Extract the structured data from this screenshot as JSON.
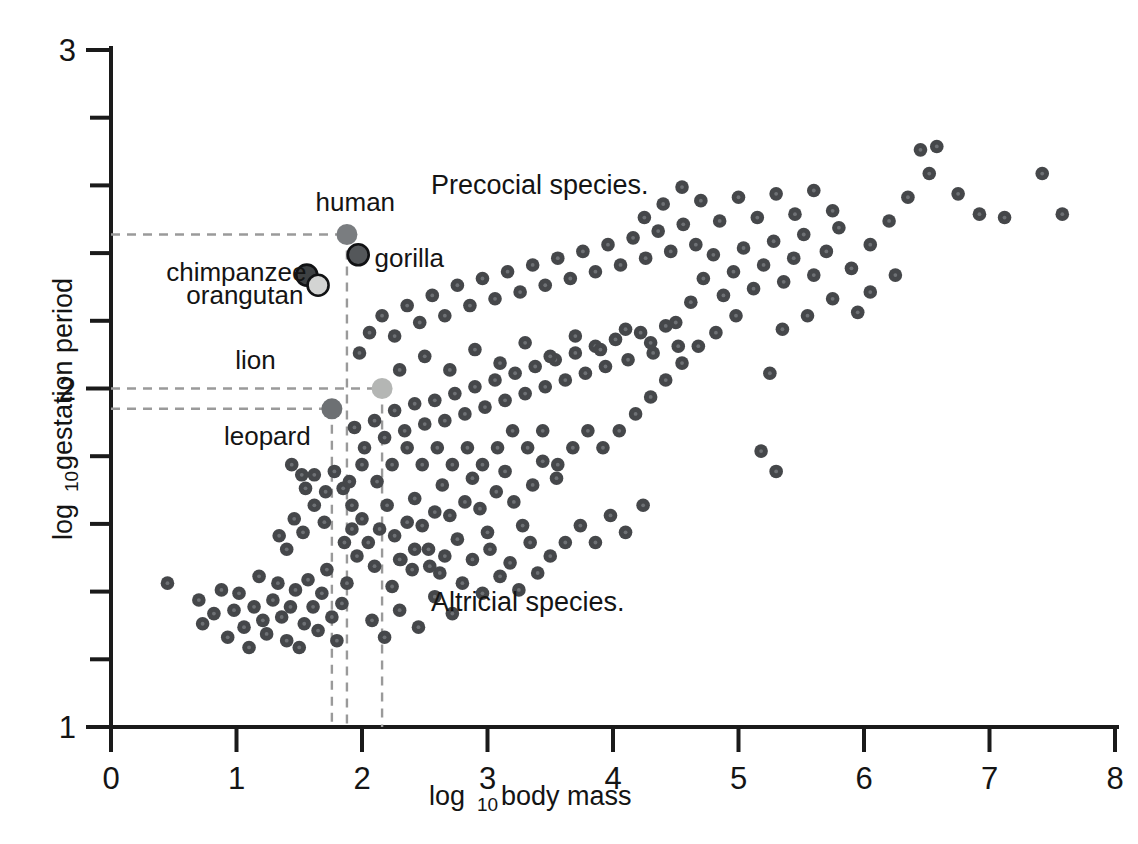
{
  "chart_data": {
    "type": "scatter",
    "title": "",
    "xlabel": "log 10 body mass",
    "xlabel_main": "log",
    "xlabel_sub": "10",
    "xlabel_tail": "body mass",
    "ylabel": "log 10 gestation period",
    "ylabel_main": "log",
    "ylabel_sub": "10",
    "ylabel_tail": "gestation period",
    "xlim": [
      0,
      8
    ],
    "ylim": [
      1,
      3
    ],
    "xticks": [
      0,
      1,
      2,
      3,
      4,
      5,
      6,
      7,
      8
    ],
    "xtick_labels": [
      "0",
      "1",
      "2",
      "3",
      "4",
      "5",
      "6",
      "7",
      "8"
    ],
    "yticks": [
      1,
      2,
      3
    ],
    "ytick_labels": [
      "1",
      "2",
      "3"
    ],
    "y_minor_ticks": [
      1.2,
      1.4,
      1.6,
      1.8,
      2.2,
      2.4,
      2.6,
      2.8
    ],
    "grid": false,
    "legend": "none",
    "marker_color": "#45474a",
    "marker_core_color": "#6e7175",
    "guide_color": "#9a9a9a",
    "annotations": [
      {
        "id": "precocial",
        "text": "Precocial species.",
        "x": 2.55,
        "y": 2.6
      },
      {
        "id": "altricial",
        "text": "Altricial species.",
        "x": 2.55,
        "y": 1.37
      }
    ],
    "highlighted": [
      {
        "name": "human",
        "label": "human",
        "x": 1.88,
        "y": 2.455,
        "color": "#7a7d80",
        "ring": false,
        "label_x": 1.63,
        "label_y": 2.55,
        "guide_h": true,
        "guide_v": true
      },
      {
        "name": "gorilla",
        "label": "gorilla",
        "x": 1.97,
        "y": 2.395,
        "color": "#54575a",
        "ring": true,
        "label_x": 2.1,
        "label_y": 2.385,
        "guide_h": false,
        "guide_v": false
      },
      {
        "name": "chimpanzee",
        "label": "chimpanzee",
        "x": 1.56,
        "y": 2.335,
        "color": "#3e4143",
        "ring": true,
        "label_x": 0.44,
        "label_y": 2.345,
        "guide_h": false,
        "guide_v": false
      },
      {
        "name": "orangutan",
        "label": "orangutan",
        "x": 1.65,
        "y": 2.305,
        "color": "#d3d4d3",
        "ring": true,
        "label_x": 0.6,
        "label_y": 2.275,
        "guide_h": false,
        "guide_v": false
      },
      {
        "name": "lion",
        "label": "lion",
        "x": 2.16,
        "y": 2.0,
        "color": "#b4b6b4",
        "ring": false,
        "label_x": 0.99,
        "label_y": 2.085,
        "guide_h": true,
        "guide_v": true
      },
      {
        "name": "leopard",
        "label": "leopard",
        "x": 1.76,
        "y": 1.94,
        "color": "#6d7073",
        "ring": false,
        "label_x": 0.9,
        "label_y": 1.86,
        "guide_h": true,
        "guide_v": true
      }
    ],
    "points": [
      [
        0.45,
        1.425
      ],
      [
        0.7,
        1.375
      ],
      [
        0.73,
        1.305
      ],
      [
        0.82,
        1.335
      ],
      [
        0.88,
        1.405
      ],
      [
        0.93,
        1.265
      ],
      [
        0.98,
        1.345
      ],
      [
        1.02,
        1.395
      ],
      [
        1.06,
        1.295
      ],
      [
        1.1,
        1.235
      ],
      [
        1.14,
        1.355
      ],
      [
        1.18,
        1.445
      ],
      [
        1.21,
        1.315
      ],
      [
        1.24,
        1.275
      ],
      [
        1.29,
        1.375
      ],
      [
        1.33,
        1.425
      ],
      [
        1.36,
        1.325
      ],
      [
        1.4,
        1.255
      ],
      [
        1.43,
        1.355
      ],
      [
        1.47,
        1.405
      ],
      [
        1.5,
        1.235
      ],
      [
        1.54,
        1.305
      ],
      [
        1.57,
        1.435
      ],
      [
        1.61,
        1.355
      ],
      [
        1.65,
        1.285
      ],
      [
        1.68,
        1.395
      ],
      [
        1.72,
        1.465
      ],
      [
        1.76,
        1.325
      ],
      [
        1.8,
        1.255
      ],
      [
        1.84,
        1.365
      ],
      [
        1.88,
        1.425
      ],
      [
        1.34,
        1.565
      ],
      [
        1.4,
        1.525
      ],
      [
        1.46,
        1.615
      ],
      [
        1.53,
        1.575
      ],
      [
        1.62,
        1.655
      ],
      [
        1.7,
        1.605
      ],
      [
        1.55,
        1.705
      ],
      [
        1.62,
        1.745
      ],
      [
        1.71,
        1.695
      ],
      [
        1.78,
        1.755
      ],
      [
        1.85,
        1.705
      ],
      [
        1.92,
        1.655
      ],
      [
        1.44,
        1.775
      ],
      [
        1.52,
        1.745
      ],
      [
        1.86,
        1.545
      ],
      [
        1.92,
        1.585
      ],
      [
        1.96,
        1.505
      ],
      [
        2.0,
        1.615
      ],
      [
        2.05,
        1.545
      ],
      [
        2.1,
        1.475
      ],
      [
        2.14,
        1.585
      ],
      [
        2.2,
        1.655
      ],
      [
        2.26,
        1.565
      ],
      [
        2.31,
        1.495
      ],
      [
        2.36,
        1.605
      ],
      [
        2.42,
        1.675
      ],
      [
        2.48,
        1.595
      ],
      [
        2.53,
        1.525
      ],
      [
        2.58,
        1.635
      ],
      [
        2.64,
        1.715
      ],
      [
        2.7,
        1.625
      ],
      [
        2.76,
        1.555
      ],
      [
        2.82,
        1.665
      ],
      [
        2.88,
        1.735
      ],
      [
        2.94,
        1.645
      ],
      [
        3.0,
        1.575
      ],
      [
        3.07,
        1.695
      ],
      [
        3.14,
        1.755
      ],
      [
        3.21,
        1.665
      ],
      [
        3.28,
        1.595
      ],
      [
        3.36,
        1.715
      ],
      [
        3.44,
        1.785
      ],
      [
        2.08,
        1.315
      ],
      [
        2.18,
        1.265
      ],
      [
        2.3,
        1.345
      ],
      [
        2.45,
        1.295
      ],
      [
        2.58,
        1.385
      ],
      [
        2.72,
        1.335
      ],
      [
        2.24,
        1.415
      ],
      [
        2.4,
        1.465
      ],
      [
        2.96,
        1.395
      ],
      [
        3.1,
        1.445
      ],
      [
        3.25,
        1.405
      ],
      [
        3.4,
        1.455
      ],
      [
        2.62,
        1.455
      ],
      [
        2.8,
        1.425
      ],
      [
        3.55,
        1.735
      ],
      [
        1.94,
        1.885
      ],
      [
        2.02,
        1.825
      ],
      [
        2.1,
        1.905
      ],
      [
        2.18,
        1.855
      ],
      [
        2.26,
        1.935
      ],
      [
        2.34,
        1.875
      ],
      [
        2.42,
        1.955
      ],
      [
        2.5,
        1.895
      ],
      [
        2.58,
        1.965
      ],
      [
        2.66,
        1.905
      ],
      [
        2.74,
        1.985
      ],
      [
        2.82,
        1.925
      ],
      [
        2.9,
        2.005
      ],
      [
        2.98,
        1.945
      ],
      [
        3.06,
        2.025
      ],
      [
        3.14,
        1.965
      ],
      [
        3.22,
        2.045
      ],
      [
        3.3,
        1.985
      ],
      [
        3.38,
        2.065
      ],
      [
        3.46,
        2.005
      ],
      [
        3.54,
        2.085
      ],
      [
        3.62,
        2.025
      ],
      [
        3.7,
        2.105
      ],
      [
        3.78,
        2.045
      ],
      [
        3.86,
        2.125
      ],
      [
        3.94,
        2.065
      ],
      [
        4.02,
        2.145
      ],
      [
        4.12,
        2.085
      ],
      [
        4.22,
        2.165
      ],
      [
        4.32,
        2.105
      ],
      [
        4.42,
        2.185
      ],
      [
        4.52,
        2.125
      ],
      [
        1.98,
        2.105
      ],
      [
        2.06,
        2.165
      ],
      [
        2.16,
        2.215
      ],
      [
        2.26,
        2.155
      ],
      [
        2.36,
        2.245
      ],
      [
        2.46,
        2.195
      ],
      [
        2.56,
        2.275
      ],
      [
        2.66,
        2.215
      ],
      [
        2.76,
        2.305
      ],
      [
        2.86,
        2.245
      ],
      [
        2.96,
        2.325
      ],
      [
        3.06,
        2.265
      ],
      [
        3.16,
        2.345
      ],
      [
        3.26,
        2.285
      ],
      [
        3.36,
        2.365
      ],
      [
        3.46,
        2.305
      ],
      [
        3.56,
        2.385
      ],
      [
        3.66,
        2.325
      ],
      [
        3.76,
        2.405
      ],
      [
        3.86,
        2.345
      ],
      [
        3.96,
        2.425
      ],
      [
        4.06,
        2.365
      ],
      [
        4.16,
        2.445
      ],
      [
        4.26,
        2.385
      ],
      [
        4.36,
        2.465
      ],
      [
        4.46,
        2.405
      ],
      [
        4.56,
        2.485
      ],
      [
        4.66,
        2.425
      ],
      [
        2.3,
        2.055
      ],
      [
        2.5,
        2.095
      ],
      [
        2.7,
        2.055
      ],
      [
        2.9,
        2.115
      ],
      [
        3.1,
        2.075
      ],
      [
        3.3,
        2.135
      ],
      [
        3.5,
        2.095
      ],
      [
        3.7,
        2.155
      ],
      [
        3.9,
        2.115
      ],
      [
        4.1,
        2.175
      ],
      [
        4.3,
        2.135
      ],
      [
        4.5,
        2.195
      ],
      [
        4.62,
        2.255
      ],
      [
        4.72,
        2.325
      ],
      [
        4.8,
        2.395
      ],
      [
        4.88,
        2.275
      ],
      [
        4.96,
        2.345
      ],
      [
        5.04,
        2.415
      ],
      [
        5.12,
        2.295
      ],
      [
        5.2,
        2.365
      ],
      [
        5.28,
        2.435
      ],
      [
        5.36,
        2.315
      ],
      [
        5.44,
        2.385
      ],
      [
        5.52,
        2.455
      ],
      [
        5.6,
        2.335
      ],
      [
        5.7,
        2.405
      ],
      [
        5.8,
        2.475
      ],
      [
        5.9,
        2.355
      ],
      [
        4.7,
        2.555
      ],
      [
        4.85,
        2.495
      ],
      [
        5.0,
        2.565
      ],
      [
        5.15,
        2.505
      ],
      [
        5.3,
        2.575
      ],
      [
        5.45,
        2.515
      ],
      [
        5.6,
        2.585
      ],
      [
        5.75,
        2.525
      ],
      [
        4.55,
        2.595
      ],
      [
        4.4,
        2.545
      ],
      [
        4.25,
        2.505
      ],
      [
        6.05,
        2.425
      ],
      [
        6.2,
        2.495
      ],
      [
        6.35,
        2.565
      ],
      [
        6.45,
        2.705
      ],
      [
        6.58,
        2.715
      ],
      [
        6.52,
        2.635
      ],
      [
        6.75,
        2.575
      ],
      [
        6.92,
        2.515
      ],
      [
        7.12,
        2.505
      ],
      [
        7.42,
        2.635
      ],
      [
        7.58,
        2.515
      ],
      [
        6.05,
        2.285
      ],
      [
        6.25,
        2.335
      ],
      [
        5.95,
        2.225
      ],
      [
        5.75,
        2.265
      ],
      [
        5.55,
        2.215
      ],
      [
        5.35,
        2.175
      ],
      [
        5.25,
        2.045
      ],
      [
        5.18,
        1.815
      ],
      [
        5.3,
        1.755
      ],
      [
        4.98,
        2.215
      ],
      [
        4.82,
        2.165
      ],
      [
        4.68,
        2.125
      ],
      [
        4.55,
        2.075
      ],
      [
        4.42,
        2.025
      ],
      [
        4.3,
        1.975
      ],
      [
        4.18,
        1.925
      ],
      [
        4.05,
        1.875
      ],
      [
        3.92,
        1.825
      ],
      [
        3.8,
        1.875
      ],
      [
        3.68,
        1.825
      ],
      [
        3.56,
        1.775
      ],
      [
        3.44,
        1.875
      ],
      [
        3.32,
        1.825
      ],
      [
        3.2,
        1.875
      ],
      [
        3.08,
        1.825
      ],
      [
        2.96,
        1.775
      ],
      [
        2.84,
        1.825
      ],
      [
        2.72,
        1.775
      ],
      [
        2.6,
        1.825
      ],
      [
        2.48,
        1.775
      ],
      [
        2.36,
        1.825
      ],
      [
        2.24,
        1.775
      ],
      [
        2.12,
        1.725
      ],
      [
        2.0,
        1.775
      ],
      [
        1.9,
        1.725
      ],
      [
        3.62,
        1.545
      ],
      [
        3.74,
        1.595
      ],
      [
        3.86,
        1.545
      ],
      [
        3.98,
        1.625
      ],
      [
        4.1,
        1.575
      ],
      [
        4.24,
        1.655
      ],
      [
        2.88,
        1.495
      ],
      [
        3.02,
        1.525
      ],
      [
        3.18,
        1.485
      ],
      [
        3.34,
        1.545
      ],
      [
        3.5,
        1.505
      ],
      [
        2.66,
        1.505
      ],
      [
        2.54,
        1.475
      ],
      [
        2.42,
        1.525
      ],
      [
        2.3,
        1.495
      ]
    ]
  }
}
